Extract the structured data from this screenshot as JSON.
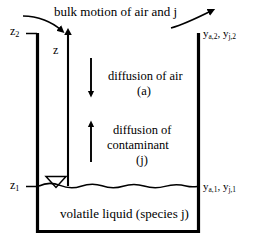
{
  "figure": {
    "type": "schematic-diagram",
    "background_color": "#ffffff",
    "line_color": "#000000"
  },
  "labels": {
    "top_title": "bulk motion of air and j",
    "z_axis": "z",
    "z_upper": "z",
    "z_upper_sub": "2",
    "z_lower": "z",
    "z_lower_sub": "1",
    "mole_fraction_top": "y",
    "mole_fraction_top_sub_a": "a,2",
    "mole_fraction_top_sep": ", y",
    "mole_fraction_top_sub_j": "j,2",
    "mole_fraction_bottom": "y",
    "mole_fraction_bottom_sub_a": "a,1",
    "mole_fraction_bottom_sep": ", y",
    "mole_fraction_bottom_sub_j": "j,1",
    "diffusion_air_line1": "diffusion of air",
    "diffusion_air_line2": "(a)",
    "diffusion_contaminant_line1": "diffusion of",
    "diffusion_contaminant_line2": "contaminant",
    "diffusion_contaminant_line3": "(j)",
    "liquid_caption": "volatile liquid (species j)"
  },
  "geometry": {
    "container_left_x": 37,
    "container_right_x": 199,
    "container_top_y": 33,
    "container_bottom_y": 232,
    "liquid_surface_y": 186,
    "z_axis_x": 68,
    "wall_thickness": 3
  },
  "arrows": {
    "bulk_in_left": "curved-arrow-pointing-down-right",
    "bulk_out_right": "curved-arrow-pointing-up-right",
    "z_axis_arrow": "vertical-arrow-up",
    "diffusion_air_arrow": "vertical-arrow-down",
    "diffusion_contaminant_arrow": "vertical-arrow-up"
  },
  "markers": {
    "liquid_level_symbol": "downward-triangle",
    "liquid_surface": "wavy-line",
    "z2_tick": "horizontal-tick",
    "z1_tick": "horizontal-tick"
  }
}
